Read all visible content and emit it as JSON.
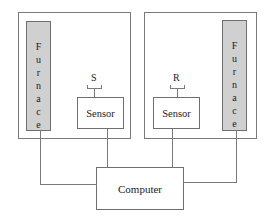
{
  "diagram": {
    "left_unit": {
      "furnace_label": "Furnace",
      "furnace_letters": [
        "F",
        "u",
        "r",
        "n",
        "a",
        "c",
        "e"
      ],
      "sensor_label": "Sensor",
      "sample_label": "S"
    },
    "right_unit": {
      "furnace_label": "Furnace",
      "furnace_letters": [
        "F",
        "u",
        "r",
        "n",
        "a",
        "c",
        "e"
      ],
      "sensor_label": "Sensor",
      "sample_label": "R"
    },
    "computer_label": "Computer",
    "colors": {
      "furnace_fill": "#d0d0d0",
      "line": "#7a7a7a",
      "background": "#ffffff"
    }
  }
}
